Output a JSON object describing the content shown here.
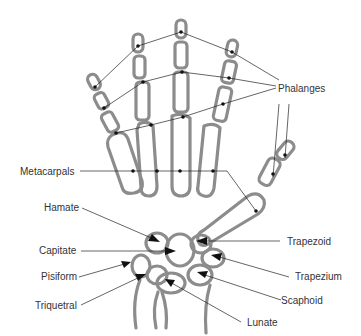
{
  "diagram": {
    "colors": {
      "bone": "#8c8c8c",
      "line": "#222222",
      "text": "#333333"
    },
    "labels": {
      "phalanges": "Phalanges",
      "metacarpals": "Metacarpals",
      "hamate": "Hamate",
      "capitate": "Capitate",
      "pisiform": "Pisiform",
      "triquetral": "Triquetral",
      "trapezoid": "Trapezoid",
      "trapezium": "Trapezium",
      "scaphoid": "Scaphoid",
      "lunate": "Lunate"
    }
  }
}
